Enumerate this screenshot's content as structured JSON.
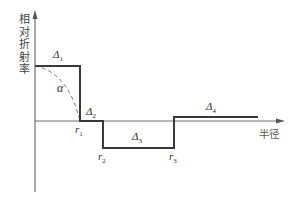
{
  "diagram": {
    "type": "refractive-index-profile",
    "y_axis_label": "相对折射率",
    "x_axis_label": "半径",
    "colors": {
      "axis": "#6e6e6e",
      "profile": "#3a3a3a",
      "dashed": "#777777",
      "text": "#333333"
    },
    "labels": {
      "delta1": {
        "base": "Δ",
        "sub": "1"
      },
      "delta2": {
        "base": "Δ",
        "sub": "2"
      },
      "delta3": {
        "base": "Δ",
        "sub": "3"
      },
      "delta4": {
        "base": "Δ",
        "sub": "4"
      },
      "alpha": "α",
      "r1": {
        "base": "r",
        "sub": "1"
      },
      "r2": {
        "base": "r",
        "sub": "2"
      },
      "r3": {
        "base": "r",
        "sub": "3"
      }
    },
    "profile_segments": [
      {
        "name": "core",
        "label": "Δ1",
        "from": "0",
        "to": "r1",
        "level": "high positive"
      },
      {
        "name": "inner-cladding",
        "label": "Δ2",
        "from": "r1",
        "to": "r2",
        "level": "zero"
      },
      {
        "name": "trench",
        "label": "Δ3",
        "from": "r2",
        "to": "r3",
        "level": "negative"
      },
      {
        "name": "outer-layer",
        "label": "Δ4",
        "from": "r3",
        "to": "end",
        "level": "slightly positive"
      }
    ]
  }
}
